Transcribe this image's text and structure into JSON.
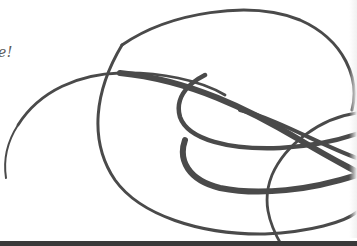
{
  "image": {
    "fragment_text": "e!",
    "description": "Decorative calligraphic swirl flourish, cropped",
    "colors": {
      "background": "#ffffff",
      "stroke": "#4a4a4a",
      "bottom_bar": "#3a3a3a"
    }
  }
}
